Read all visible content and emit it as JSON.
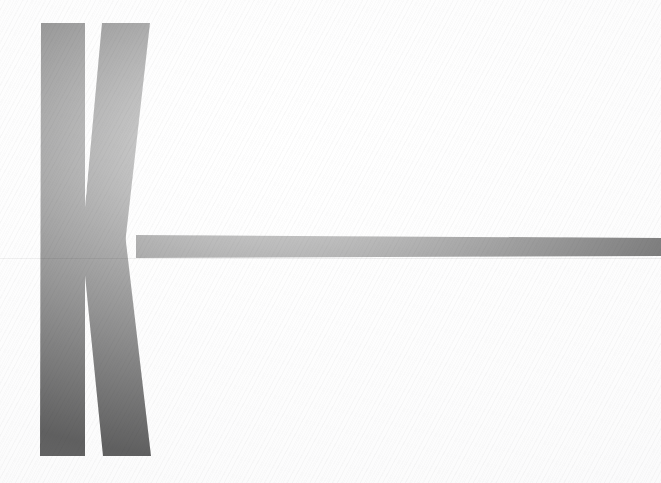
{
  "artwork": {
    "title": "Letter K with extended horizontal rule",
    "description": "Large bold black letter K at left with a long horizontal bar running from the K to the right edge of the sheet",
    "alt_text": "K",
    "character": "K",
    "medium": "scanned print on paper",
    "ink_color": "#0b0b0b",
    "paper_color": "#fdfdfd",
    "seam_color": "#0d0d0d"
  },
  "canvas": {
    "width": 661,
    "height": 483,
    "background": "#fdfdfd"
  },
  "shapes": {
    "left_stem": {
      "name": "left-vertical-stem",
      "fill": "#0b0b0b",
      "points": "41,23 85,23 85,456 40,456"
    },
    "upper_diagonal": {
      "name": "upper-diagonal-stroke",
      "fill": "#0b0b0b",
      "points": "102,23 150,23 123,262 80,262"
    },
    "lower_diagonal": {
      "name": "lower-diagonal-stroke",
      "fill": "#0b0b0b",
      "points": "80,225 124,225 151,456 103,456"
    },
    "horizontal_bar": {
      "name": "horizontal-rule-bar",
      "fill": "#0b0b0b",
      "points": "136,235 661,238 661,256 136,258"
    },
    "gap_upper": {
      "name": "upper-counter-gap",
      "fill": "#fdfdfd",
      "points": "87,23 100,23 86,196"
    },
    "gap_lower": {
      "name": "lower-counter-gap",
      "fill": "#fdfdfd",
      "points": "85,281 87,456 101,456"
    }
  },
  "seam": {
    "name": "scan-seam-line",
    "y": 258,
    "opacity": 0.055
  }
}
